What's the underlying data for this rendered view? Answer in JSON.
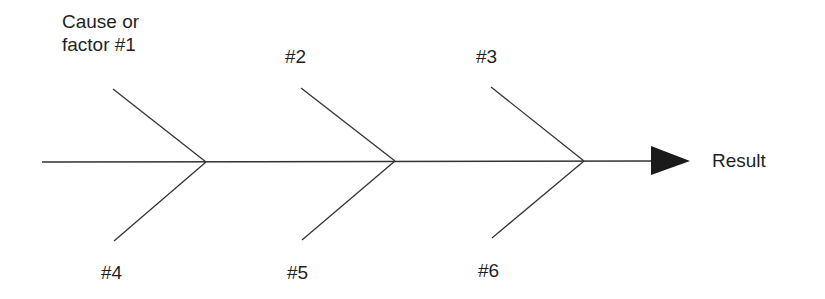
{
  "diagram": {
    "type": "cause-and-effect (fishbone)",
    "result_label": "Result",
    "causes": [
      {
        "id": 1,
        "label_line1": "Cause or",
        "label_line2": "factor #1",
        "position": "top"
      },
      {
        "id": 2,
        "label": "#2",
        "position": "top"
      },
      {
        "id": 3,
        "label": "#3",
        "position": "top"
      },
      {
        "id": 4,
        "label": "#4",
        "position": "bottom"
      },
      {
        "id": 5,
        "label": "#5",
        "position": "bottom"
      },
      {
        "id": 6,
        "label": "#6",
        "position": "bottom"
      }
    ],
    "colors": {
      "line": "#333333",
      "text": "#1f1f1f",
      "background": "#ffffff"
    }
  }
}
